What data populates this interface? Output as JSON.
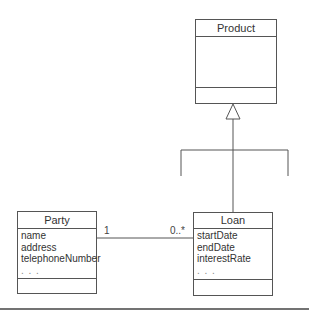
{
  "diagram": {
    "type": "UML class diagram",
    "classes": [
      {
        "id": "product",
        "name": "Product",
        "attributes": [],
        "operations": []
      },
      {
        "id": "party",
        "name": "Party",
        "attributes": [
          "name",
          "address",
          "telephoneNumber",
          ". . ."
        ],
        "operations": []
      },
      {
        "id": "loan",
        "name": "Loan",
        "attributes": [
          "startDate",
          "endDate",
          "interestRate",
          ". . ."
        ],
        "operations": []
      }
    ],
    "relationships": [
      {
        "type": "generalization",
        "from": "loan",
        "to": "product",
        "note": "Loan is one of several subclasses of Product"
      },
      {
        "type": "association",
        "from": "party",
        "to": "loan",
        "multiplicity_from": "1",
        "multiplicity_to": "0..*"
      }
    ]
  },
  "colors": {
    "line": "#555555",
    "text": "#333333",
    "background": "#ffffff"
  }
}
